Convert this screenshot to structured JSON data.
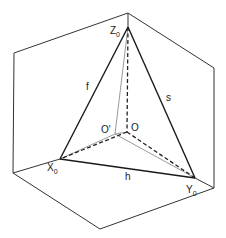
{
  "diagram": {
    "type": "geometric-construction",
    "colors": {
      "frame": "#333333",
      "triangle": "#1a1a1a",
      "dashed": "#222222",
      "light": "#9a9a9a"
    },
    "points": {
      "cube_top": [
        128,
        13
      ],
      "cube_left_upper": [
        14,
        53
      ],
      "cube_left_lower": [
        13,
        173
      ],
      "cube_right_upper": [
        214,
        68
      ],
      "cube_right_lower": [
        214,
        188
      ],
      "cube_bottom": [
        100,
        229
      ],
      "Z0": [
        128,
        27
      ],
      "X0": [
        60,
        159
      ],
      "Y0": [
        195,
        178
      ],
      "O": [
        127,
        132
      ],
      "O_prime": [
        115,
        134
      ]
    },
    "labels": {
      "Z0": {
        "main": "Z",
        "sub": "0"
      },
      "X0": {
        "main": "X",
        "sub": "0"
      },
      "Y0": {
        "main": "Y",
        "sub": "0"
      },
      "O": "O",
      "O_prime": "O'",
      "f": "f",
      "s": "s",
      "h": "h"
    }
  }
}
